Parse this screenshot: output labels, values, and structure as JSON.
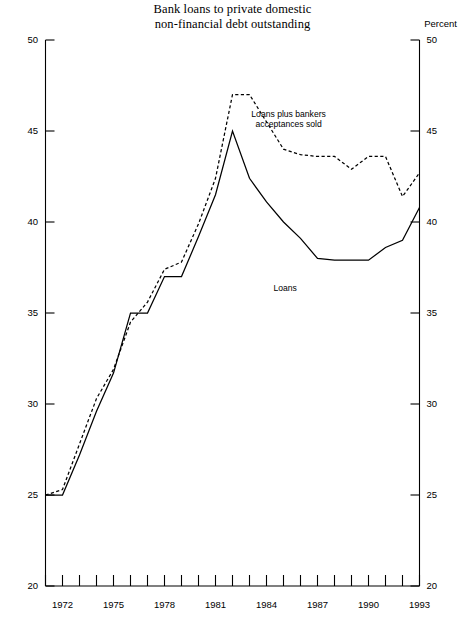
{
  "chart_data": {
    "type": "line",
    "title": "Bank loans to private domestic non-financial debt outstanding",
    "title_line1": "Bank loans to private domestic",
    "title_line2": "non-financial  debt outstanding",
    "ylabel": "Percent",
    "xlabel": "",
    "ylim": [
      20,
      50
    ],
    "xlim": [
      1971,
      1993
    ],
    "grid": false,
    "legend_position": "inline-annotations",
    "ytick_labels": [
      "20",
      "25",
      "30",
      "35",
      "40",
      "45",
      "50"
    ],
    "ytick_values": [
      20,
      25,
      30,
      35,
      40,
      45,
      50
    ],
    "xtick_values": [
      1971,
      1972,
      1973,
      1974,
      1975,
      1976,
      1977,
      1978,
      1979,
      1980,
      1981,
      1982,
      1983,
      1984,
      1985,
      1986,
      1987,
      1988,
      1989,
      1990,
      1991,
      1992,
      1993
    ],
    "xtick_labels_shown": [
      "1972",
      "1975",
      "1978",
      "1981",
      "1984",
      "1987",
      "1990",
      "1993"
    ],
    "xtick_labels_shown_values": [
      1972,
      1975,
      1978,
      1981,
      1984,
      1987,
      1990,
      1993
    ],
    "x": [
      1971,
      1972,
      1973,
      1974,
      1975,
      1976,
      1977,
      1978,
      1979,
      1980,
      1981,
      1982,
      1983,
      1984,
      1985,
      1986,
      1987,
      1988,
      1989,
      1990,
      1991,
      1992,
      1993
    ],
    "series": [
      {
        "name": "Loans",
        "style": "solid",
        "color": "#000000",
        "annotation": "Loans",
        "values": [
          25.0,
          25.0,
          27.2,
          29.6,
          31.7,
          35.0,
          35.0,
          37.0,
          37.0,
          39.2,
          41.5,
          45.0,
          42.4,
          41.1,
          40.0,
          39.1,
          38.0,
          37.9,
          37.9,
          37.9,
          38.6,
          39.0,
          40.8
        ]
      },
      {
        "name": "Loans plus bankers acceptances sold",
        "style": "dashed",
        "color": "#000000",
        "annotation": "Loans plus bankers acceptances sold",
        "annotation_line1": "Loans plus bankers",
        "annotation_line2": "acceptances sold",
        "values": [
          25.0,
          25.3,
          27.8,
          30.3,
          31.9,
          34.5,
          35.6,
          37.4,
          37.8,
          39.9,
          42.4,
          47.0,
          47.0,
          45.5,
          44.0,
          43.7,
          43.6,
          43.6,
          42.9,
          43.6,
          43.6,
          41.4,
          42.7
        ]
      }
    ]
  }
}
